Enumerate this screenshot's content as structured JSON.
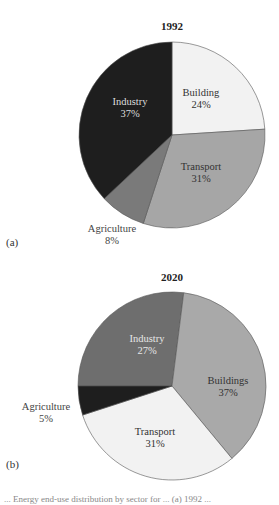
{
  "chart_data": [
    {
      "type": "pie",
      "title": "1992",
      "panel_label": "(a)",
      "categories": [
        "Building",
        "Transport",
        "Agriculture",
        "Industry"
      ],
      "values": [
        24,
        31,
        8,
        37
      ],
      "labels": [
        "Building 24%",
        "Transport 31%",
        "Agriculture 8%",
        "Industry 37%"
      ],
      "colors": [
        "#f2f2f2",
        "#a6a6a6",
        "#7a7a7a",
        "#1e1e1e"
      ],
      "start_angle_deg": 0,
      "direction": "clockwise",
      "center": [
        172,
        135
      ],
      "radius": 93,
      "label_pos": [
        [
          201,
          96
        ],
        [
          201,
          170
        ],
        [
          112,
          232
        ],
        [
          130,
          105
        ]
      ],
      "label_color": [
        "#333333",
        "#333333",
        "#444444",
        "#dddddd"
      ]
    },
    {
      "type": "pie",
      "title": "2020",
      "panel_label": "(b)",
      "categories": [
        "Industry",
        "Buildings",
        "Transport",
        "Agriculture"
      ],
      "values": [
        27,
        37,
        31,
        5
      ],
      "labels": [
        "Industry 27%",
        "Buildings 37%",
        "Transport 31%",
        "Agriculture 5%"
      ],
      "colors": [
        "#6e6e6e",
        "#a9a9a9",
        "#f2f2f2",
        "#1e1e1e"
      ],
      "start_angle_deg": 270,
      "direction": "clockwise",
      "center": [
        172,
        386
      ],
      "radius": 94,
      "label_pos": [
        [
          147,
          342
        ],
        [
          228,
          384
        ],
        [
          155,
          435
        ],
        [
          46,
          410
        ]
      ],
      "label_color": [
        "#e6e6e6",
        "#333333",
        "#333333",
        "#444444"
      ]
    }
  ],
  "panels": {
    "a": {
      "title": "1992",
      "label": "(a)"
    },
    "b": {
      "title": "2020",
      "label": "(b)"
    }
  },
  "caption": "... Energy end-use distribution by sector for ... (a) 1992 ..."
}
